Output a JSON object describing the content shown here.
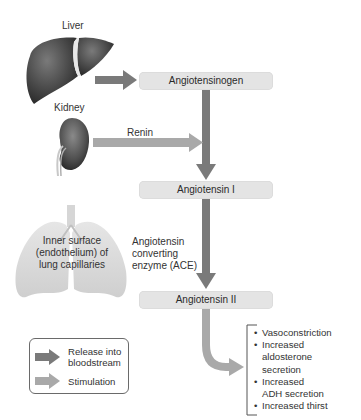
{
  "organs": {
    "liver": {
      "label": "Liver",
      "icon": "liver-illustration"
    },
    "kidney": {
      "label": "Kidney",
      "icon": "kidney-illustration"
    },
    "lungs": {
      "label_lines": [
        "Inner surface",
        "(endothelium) of",
        "lung capillaries"
      ],
      "icon": "lungs-illustration"
    }
  },
  "pathway": {
    "step1": "Angiotensinogen",
    "step2": "Angiotensin I",
    "step3": "Angiotensin II"
  },
  "enzymes": {
    "renin": "Renin",
    "ace_lines": [
      "Angiotensin",
      "converting",
      "enzyme (ACE)"
    ]
  },
  "effects": {
    "items": [
      {
        "lines": [
          "Vasoconstriction"
        ]
      },
      {
        "lines": [
          "Increased",
          "aldosterone",
          "secretion"
        ]
      },
      {
        "lines": [
          "Increased",
          "ADH secretion"
        ]
      },
      {
        "lines": [
          "Increased thirst"
        ]
      }
    ]
  },
  "legend": {
    "release_lines": [
      "Release into",
      "bloodstream"
    ],
    "stimulation": "Stimulation"
  },
  "colors": {
    "release_arrow": "#7a7a7a",
    "stimulation_arrow": "#a9a9a9",
    "box_fill": "#e4e4e4"
  }
}
